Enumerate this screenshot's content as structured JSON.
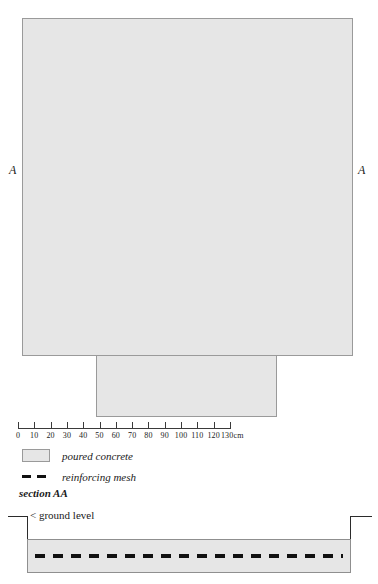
{
  "drawing": {
    "plan": {
      "slab_label": "poured concrete slab plan",
      "apron_label": "poured concrete apron",
      "section_mark_left": "A",
      "section_mark_right": "A"
    },
    "scale": {
      "unit": "cm",
      "ticks": [
        0,
        10,
        20,
        30,
        40,
        50,
        60,
        70,
        80,
        90,
        100,
        110,
        120,
        130
      ],
      "labels": [
        "0",
        "10",
        "20",
        "30",
        "40",
        "50",
        "60",
        "70",
        "80",
        "90",
        "100",
        "110",
        "120",
        "130cm"
      ],
      "min": 0,
      "max": 130
    },
    "legend": {
      "items": [
        {
          "swatch": "filled-box",
          "label": "poured concrete"
        },
        {
          "swatch": "dashed-line",
          "label": "reinforcing mesh"
        }
      ]
    },
    "section": {
      "title": "section AA",
      "ground_level_label": "< ground level",
      "slab_label": "poured concrete slab section",
      "mesh_label": "reinforcing mesh"
    },
    "colors": {
      "concrete_fill": "#e6e6e6",
      "concrete_outline": "#9a9a9a",
      "mesh": "#111111",
      "ground_line": "#2b2b2b",
      "background": "#ffffff"
    }
  }
}
